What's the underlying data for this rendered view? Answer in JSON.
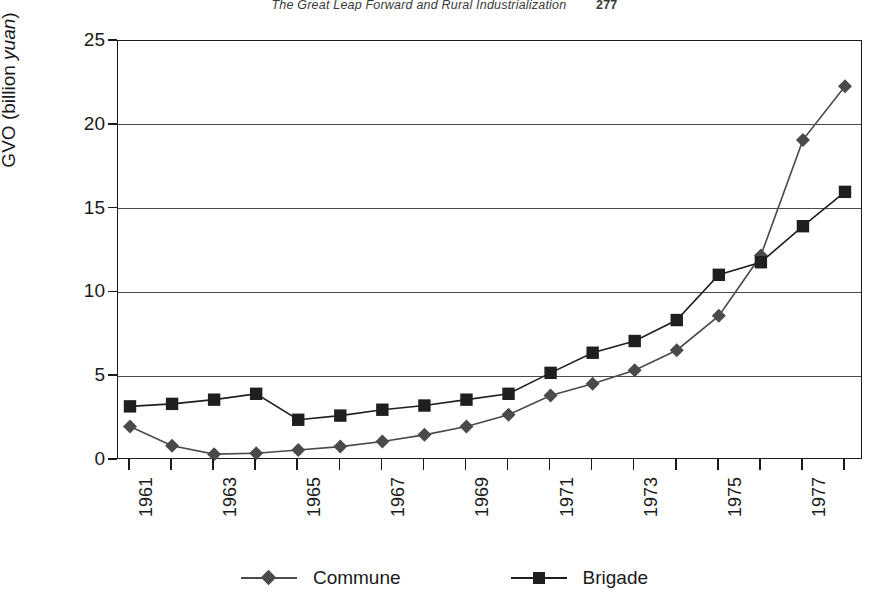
{
  "header": {
    "title": "The Great Leap Forward and Rural Industrialization",
    "page_number": "277"
  },
  "chart_data": {
    "type": "line",
    "title": "",
    "xlabel": "",
    "ylabel": "GVO (billion yuan)",
    "ylabel_plain": "GVO (billion ",
    "ylabel_italic": "yuan",
    "ylabel_tail": ")",
    "ylim": [
      0,
      25
    ],
    "ytick_values": [
      0,
      5,
      10,
      15,
      20,
      25
    ],
    "ytick_labels": [
      "0",
      "5",
      "10",
      "15",
      "20",
      "25"
    ],
    "grid": true,
    "legend_position": "bottom",
    "x": [
      1961,
      1962,
      1963,
      1964,
      1965,
      1966,
      1967,
      1968,
      1969,
      1970,
      1971,
      1972,
      1973,
      1974,
      1975,
      1976,
      1977,
      1978
    ],
    "xtick_labels": [
      "1961",
      "1963",
      "1965",
      "1967",
      "1969",
      "1971",
      "1973",
      "1975",
      "1977"
    ],
    "xtick_label_years": [
      1961,
      1963,
      1965,
      1967,
      1969,
      1971,
      1973,
      1975,
      1977
    ],
    "series": [
      {
        "name": "Commune",
        "marker": "diamond",
        "color": "#4a4a4a",
        "values": [
          2.0,
          0.85,
          0.35,
          0.4,
          0.6,
          0.8,
          1.1,
          1.5,
          2.0,
          2.7,
          3.85,
          4.55,
          5.35,
          6.55,
          8.6,
          12.2,
          19.1,
          22.3
        ]
      },
      {
        "name": "Brigade",
        "marker": "square",
        "color": "#1f1f1f",
        "values": [
          3.2,
          3.35,
          3.6,
          3.95,
          2.4,
          2.65,
          3.0,
          3.25,
          3.6,
          3.95,
          5.2,
          6.4,
          7.1,
          8.35,
          11.05,
          11.8,
          13.95,
          16.0
        ]
      }
    ]
  }
}
